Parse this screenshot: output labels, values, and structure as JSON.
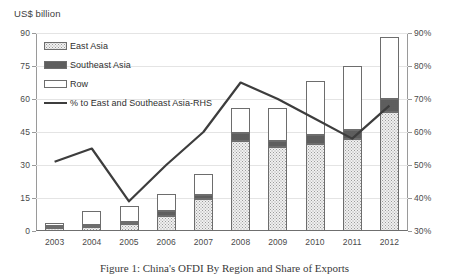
{
  "axis_title": "US$ billion",
  "caption": "Figure 1: China's OFDI By Region and Share of Exports",
  "legend": [
    {
      "key": "east_asia",
      "label": "East Asia",
      "style": "swatch-dotted-light"
    },
    {
      "key": "southeast",
      "label": "Southeast Asia",
      "style": "swatch-dotted-dark"
    },
    {
      "key": "row",
      "label": "Row",
      "style": "swatch-white"
    },
    {
      "key": "pct_line",
      "label": "% to East and Southeast Asia-RHS",
      "style": "line"
    }
  ],
  "chart_data": {
    "type": "bar",
    "title": "",
    "subtitle": "",
    "xlabel": "",
    "ylabel": "US$ billion",
    "y2label": "",
    "categories": [
      "2003",
      "2004",
      "2005",
      "2006",
      "2007",
      "2008",
      "2009",
      "2010",
      "2011",
      "2012"
    ],
    "ylim": [
      0,
      90
    ],
    "yticks": [
      0,
      15,
      30,
      45,
      60,
      75,
      90
    ],
    "ytick_labels": [
      "0",
      "15",
      "30",
      "45",
      "60",
      "75",
      "90"
    ],
    "y2lim": [
      30,
      90
    ],
    "y2ticks": [
      30,
      40,
      50,
      60,
      70,
      80,
      90
    ],
    "y2tick_labels": [
      "30%",
      "40%",
      "50%",
      "60%",
      "70%",
      "80%",
      "90%"
    ],
    "grid": true,
    "legend_position": "upper-left-inside",
    "stacked": true,
    "series": [
      {
        "name": "East Asia",
        "values": [
          1.5,
          2.0,
          3.0,
          7.0,
          14.5,
          41.0,
          38.0,
          39.5,
          42.0,
          54.0
        ]
      },
      {
        "name": "Southeast Asia",
        "values": [
          0.6,
          0.8,
          1.2,
          2.0,
          2.0,
          3.5,
          3.0,
          4.0,
          4.0,
          6.0
        ]
      },
      {
        "name": "Row",
        "values": [
          1.4,
          6.2,
          7.3,
          8.0,
          9.5,
          11.5,
          15.0,
          24.5,
          29.0,
          28.0
        ]
      }
    ],
    "line_series": {
      "name": "% to East and Southeast Asia-RHS",
      "axis": "right",
      "values": [
        51,
        55,
        39,
        50,
        60,
        75,
        70,
        64,
        58,
        68
      ]
    }
  }
}
